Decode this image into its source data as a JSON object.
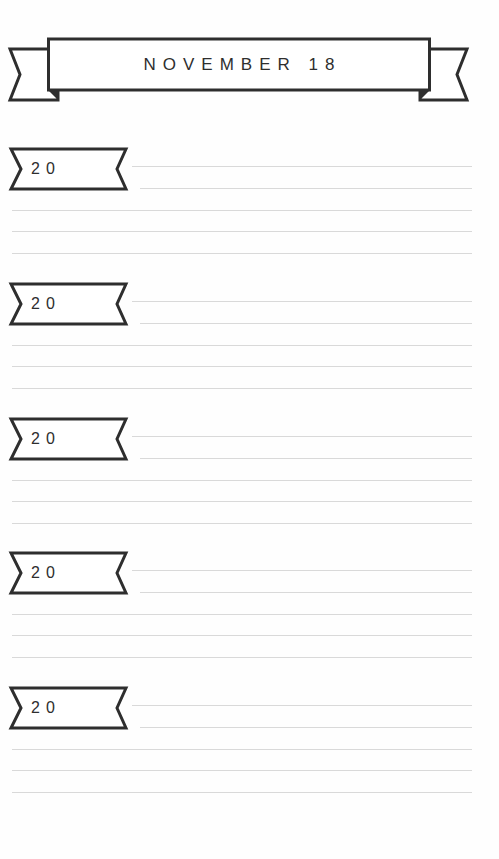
{
  "header": {
    "title": "NOVEMBER 18"
  },
  "sections": [
    {
      "year_label": "20"
    },
    {
      "year_label": "20"
    },
    {
      "year_label": "20"
    },
    {
      "year_label": "20"
    },
    {
      "year_label": "20"
    }
  ],
  "colors": {
    "ink": "#2e2e2e",
    "rule_line": "#d9d9d9",
    "paper": "#ffffff"
  }
}
